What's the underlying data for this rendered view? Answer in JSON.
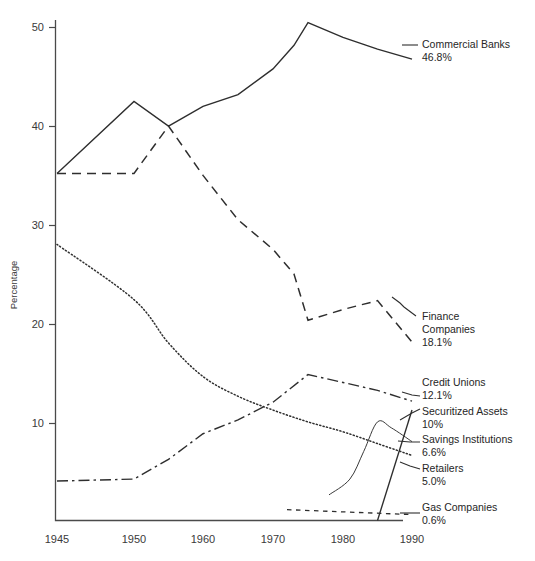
{
  "chart_data": {
    "type": "line",
    "title": "",
    "xlabel": "",
    "ylabel": "Percentage",
    "xlim": [
      1945,
      1990
    ],
    "ylim": [
      0,
      50
    ],
    "grid": false,
    "legend_position": "right-inline-labels",
    "x_ticks": [
      "1945",
      "1950",
      "1960",
      "1970",
      "1980",
      "1990"
    ],
    "x_tick_values": [
      1945,
      1950,
      1960,
      1970,
      1980,
      1990
    ],
    "y_ticks": [
      "10",
      "20",
      "30",
      "40",
      "50"
    ],
    "y_tick_values": [
      10,
      20,
      30,
      40,
      50
    ],
    "series": [
      {
        "name": "Commercial Banks",
        "end_value_label": "46.8%",
        "end_value": 46.8,
        "line_style": "solid",
        "x": [
          1945,
          1950,
          1955,
          1960,
          1965,
          1970,
          1973,
          1975,
          1980,
          1985,
          1990
        ],
        "values": [
          35.2,
          42.5,
          40.0,
          42.0,
          43.2,
          45.8,
          48.2,
          50.5,
          49.0,
          47.8,
          46.8
        ]
      },
      {
        "name": "Finance Companies",
        "end_value_label": "18.1%",
        "end_value": 18.1,
        "line_style": "dashed",
        "x": [
          1945,
          1950,
          1955,
          1960,
          1965,
          1970,
          1973,
          1975,
          1980,
          1985,
          1990
        ],
        "values": [
          35.2,
          35.2,
          40.0,
          35.0,
          30.5,
          27.5,
          25.0,
          20.3,
          21.4,
          22.3,
          18.1
        ]
      },
      {
        "name": "Credit Unions",
        "end_value_label": "12.1%",
        "end_value": 12.1,
        "line_style": "dash-dot",
        "x": [
          1945,
          1950,
          1955,
          1960,
          1965,
          1970,
          1975,
          1980,
          1985,
          1990
        ],
        "values": [
          4.0,
          4.2,
          6.2,
          8.8,
          10.2,
          12.0,
          14.8,
          14.0,
          13.2,
          12.1
        ]
      },
      {
        "name": "Savings Institutions",
        "end_value_label": "6.6%",
        "end_value": 6.6,
        "line_style": "dotted",
        "x": [
          1945,
          1950,
          1955,
          1960,
          1965,
          1970,
          1975,
          1980,
          1985,
          1990
        ],
        "values": [
          28.0,
          22.4,
          18.0,
          14.6,
          12.6,
          11.2,
          10.0,
          9.0,
          7.8,
          6.6
        ]
      },
      {
        "name": "Securitized Assets",
        "end_value_label": "10%",
        "end_value": 10.0,
        "line_style": "solid-thin",
        "x": [
          1978,
          1981,
          1983,
          1985,
          1987,
          1990
        ],
        "values": [
          2.6,
          4.2,
          7.0,
          10.0,
          9.4,
          8.0
        ]
      },
      {
        "name": "Retailers",
        "end_value_label": "5.0%",
        "end_value": 5.0,
        "line_style": "solid",
        "x": [
          1985,
          1990
        ],
        "values": [
          0.0,
          11.2
        ]
      },
      {
        "name": "Gas Companies",
        "end_value_label": "0.6%",
        "end_value": 0.6,
        "line_style": "loose-dash",
        "x": [
          1972,
          1990
        ],
        "values": [
          1.1,
          0.6
        ]
      }
    ]
  },
  "axis": {
    "y_title": "Percentage"
  },
  "labels": {
    "commercial_banks": {
      "name": "Commercial Banks",
      "value": "46.8%"
    },
    "finance_companies_l1": "Finance",
    "finance_companies_l2": "Companies",
    "finance_companies_val": "18.1%",
    "credit_unions": {
      "name": "Credit Unions",
      "value": "12.1%"
    },
    "securitized_assets": {
      "name": "Securitized Assets",
      "value": "10%"
    },
    "savings_institutions": {
      "name": "Savings Institutions",
      "value": "6.6%"
    },
    "retailers": {
      "name": "Retailers",
      "value": "5.0%"
    },
    "gas_companies": {
      "name": "Gas Companies",
      "value": "0.6%"
    }
  },
  "ticks": {
    "x": [
      "1945",
      "1950",
      "1960",
      "1970",
      "1980",
      "1990"
    ],
    "y": [
      "50",
      "40",
      "30",
      "20",
      "10"
    ]
  }
}
